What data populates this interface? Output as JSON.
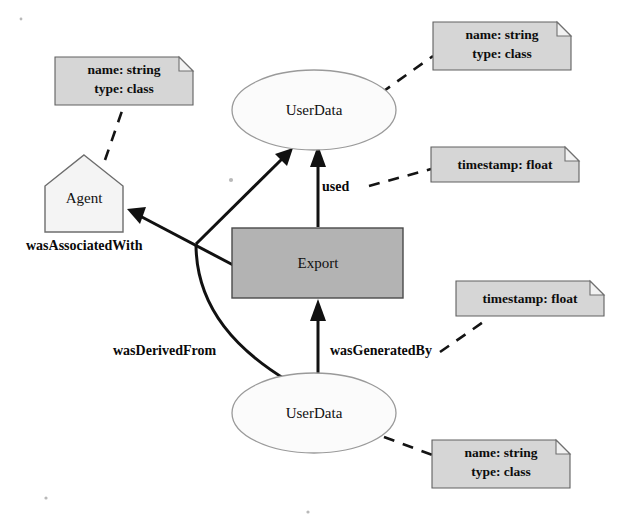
{
  "diagram": {
    "background_color": "#ffffff",
    "nodes": [
      {
        "id": "userdata-top",
        "label": "UserData",
        "shape": "ellipse",
        "fill": "#fbfbfb",
        "stroke": "#9a9a9a",
        "cx": 314,
        "cy": 110,
        "rx": 82,
        "ry": 40
      },
      {
        "id": "agent",
        "label": "Agent",
        "shape": "pentagon",
        "fill": "#f4f4f4",
        "stroke": "#6d6d6d",
        "cx": 84,
        "cy": 193,
        "width": 78,
        "height": 77
      },
      {
        "id": "export",
        "label": "Export",
        "shape": "rectangle",
        "fill": "#b3b3b3",
        "stroke": "#4a4a4a",
        "x": 232,
        "y": 228,
        "width": 171,
        "height": 70
      },
      {
        "id": "userdata-bottom",
        "label": "UserData",
        "shape": "ellipse",
        "fill": "#fbfbfb",
        "stroke": "#9a9a9a",
        "cx": 314,
        "cy": 413,
        "rx": 82,
        "ry": 40
      }
    ],
    "notes": [
      {
        "id": "note-userdata-top",
        "lines": [
          "name: string",
          "type: class"
        ],
        "x": 433,
        "y": 22,
        "width": 138,
        "height": 48,
        "attaches_to": "userdata-top"
      },
      {
        "id": "note-agent",
        "lines": [
          "name: string",
          "type: class"
        ],
        "x": 55,
        "y": 57,
        "width": 138,
        "height": 48,
        "attaches_to": "agent"
      },
      {
        "id": "note-used",
        "lines": [
          "timestamp: float"
        ],
        "x": 431,
        "y": 147,
        "width": 148,
        "height": 35,
        "attaches_to": "used-edge"
      },
      {
        "id": "note-wasgeneratedby",
        "lines": [
          "timestamp: float"
        ],
        "x": 456,
        "y": 281,
        "width": 148,
        "height": 35,
        "attaches_to": "wasgeneratedby-edge"
      },
      {
        "id": "note-userdata-bottom",
        "lines": [
          "name: string",
          "type: class"
        ],
        "x": 432,
        "y": 440,
        "width": 138,
        "height": 48,
        "attaches_to": "userdata-bottom"
      }
    ],
    "edges": [
      {
        "id": "used-edge",
        "label": "used",
        "from": "export",
        "to": "userdata-top",
        "label_x": 322,
        "label_y": 188,
        "style": "solid-arrow"
      },
      {
        "id": "wasassociatedwith-edge",
        "label": "wasAssociatedWith",
        "from": "export",
        "to": "agent",
        "label_x": 26,
        "label_y": 247,
        "style": "solid-arrow"
      },
      {
        "id": "wasderivedfrom-edge",
        "label": "wasDerivedFrom",
        "from": "userdata-bottom",
        "to": "userdata-top",
        "label_x": 113,
        "label_y": 352,
        "style": "solid-curved-arrow"
      },
      {
        "id": "wasgeneratedby-edge",
        "label": "wasGeneratedBy",
        "from": "userdata-bottom",
        "to": "export",
        "label_x": 330,
        "label_y": 352,
        "style": "solid-arrow"
      }
    ]
  }
}
